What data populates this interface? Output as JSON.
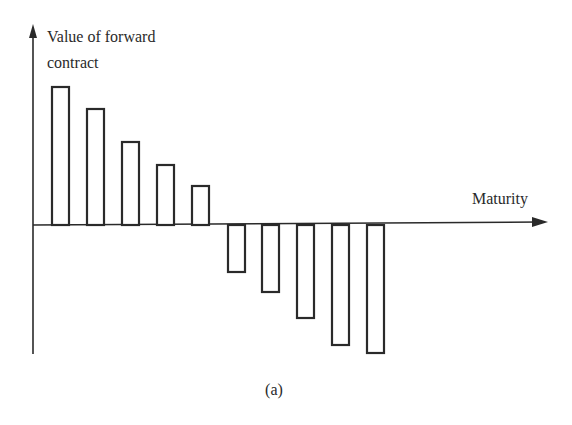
{
  "chart_data": {
    "type": "bar",
    "title": "",
    "ylabel": "Value of forward contract",
    "ylabel_lines": [
      "Value of forward",
      "contract"
    ],
    "xlabel": "Maturity",
    "caption": "(a)",
    "categories": [
      "1",
      "2",
      "3",
      "4",
      "5",
      "6",
      "7",
      "8",
      "9",
      "10"
    ],
    "values": [
      138,
      116,
      83,
      60,
      39,
      -47,
      -67,
      -93,
      -120,
      -128
    ],
    "value_units": "relative (no tick labels shown)",
    "ylim": [
      -140,
      150
    ],
    "grid": false,
    "legend": null,
    "bar_style": "outlined, white fill",
    "axis_arrows": true
  },
  "colors": {
    "ink": "#2a2a2a",
    "background": "#ffffff"
  },
  "layout": {
    "origin_x": 33,
    "baseline_y": 225,
    "bar_width": 17,
    "bar_x": [
      52,
      87,
      122,
      157,
      192,
      228,
      262,
      297,
      332,
      367
    ],
    "x_axis_end": 548,
    "y_axis_top": 24,
    "y_axis_bottom": 354
  }
}
